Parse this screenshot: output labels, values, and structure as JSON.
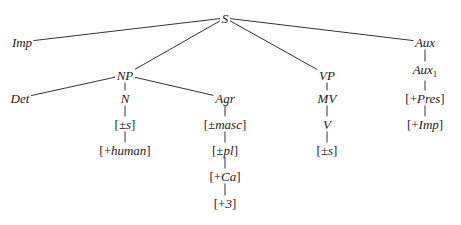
{
  "diagram": {
    "type": "syntax-tree",
    "line_color": "#333333",
    "text_color": "#222222",
    "nodes": [
      {
        "id": "S",
        "label": "S",
        "x": 225,
        "y": 18,
        "italic": true
      },
      {
        "id": "Imp",
        "label": "Imp",
        "x": 22,
        "y": 42,
        "italic": true
      },
      {
        "id": "NP",
        "label": "NP",
        "x": 125,
        "y": 75,
        "italic": true
      },
      {
        "id": "VP",
        "label": "VP",
        "x": 327,
        "y": 75,
        "italic": true
      },
      {
        "id": "Aux",
        "label": "Aux",
        "x": 425,
        "y": 42,
        "italic": true
      },
      {
        "id": "Det",
        "label": "Det",
        "x": 20,
        "y": 98,
        "italic": true
      },
      {
        "id": "N",
        "label": "N",
        "x": 125,
        "y": 98,
        "italic": true
      },
      {
        "id": "Agr",
        "label": "Agr",
        "x": 225,
        "y": 98,
        "italic": true
      },
      {
        "id": "N_s",
        "pre": "[±",
        "core": "s",
        "post": "]",
        "x": 125,
        "y": 124
      },
      {
        "id": "N_human",
        "pre": "[+",
        "core": "human",
        "post": "]",
        "x": 125,
        "y": 150
      },
      {
        "id": "Agr_masc",
        "pre": "[±",
        "core": "masc",
        "post": "]",
        "x": 225,
        "y": 124
      },
      {
        "id": "Agr_pl",
        "pre": "[±",
        "core": "pl",
        "post": "]",
        "x": 225,
        "y": 150
      },
      {
        "id": "Agr_Ca",
        "pre": "[+",
        "core": "Ca",
        "post": "]",
        "x": 225,
        "y": 176
      },
      {
        "id": "Agr_3",
        "pre": "[+",
        "core": "3",
        "post": "]",
        "x": 225,
        "y": 203
      },
      {
        "id": "MV",
        "label": "MV",
        "x": 327,
        "y": 98,
        "italic": true
      },
      {
        "id": "V",
        "label": "V",
        "x": 327,
        "y": 124,
        "italic": true
      },
      {
        "id": "V_s",
        "pre": "[±",
        "core": "s",
        "post": "]",
        "x": 327,
        "y": 150
      },
      {
        "id": "Aux1",
        "label": "Aux",
        "sub": "1",
        "x": 425,
        "y": 71,
        "italic": true
      },
      {
        "id": "Aux_Pres",
        "pre": "[+",
        "core": "Pres",
        "post": "]",
        "x": 425,
        "y": 98
      },
      {
        "id": "Aux_Imp",
        "pre": "[+",
        "core": "Imp",
        "post": "]",
        "x": 425,
        "y": 124
      }
    ],
    "edges": [
      [
        "S",
        "Imp"
      ],
      [
        "S",
        "NP"
      ],
      [
        "S",
        "VP"
      ],
      [
        "S",
        "Aux"
      ],
      [
        "NP",
        "Det"
      ],
      [
        "NP",
        "N"
      ],
      [
        "NP",
        "Agr"
      ],
      [
        "N",
        "N_s"
      ],
      [
        "N_s",
        "N_human"
      ],
      [
        "Agr",
        "Agr_masc"
      ],
      [
        "Agr_masc",
        "Agr_pl"
      ],
      [
        "Agr_pl",
        "Agr_Ca"
      ],
      [
        "Agr_Ca",
        "Agr_3"
      ],
      [
        "VP",
        "MV"
      ],
      [
        "MV",
        "V"
      ],
      [
        "V",
        "V_s"
      ],
      [
        "Aux",
        "Aux1"
      ],
      [
        "Aux1",
        "Aux_Pres"
      ],
      [
        "Aux_Pres",
        "Aux_Imp"
      ]
    ]
  }
}
